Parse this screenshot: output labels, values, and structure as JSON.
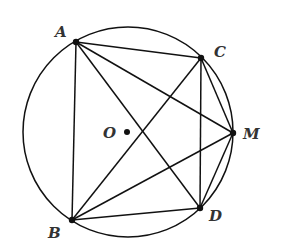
{
  "diagram": {
    "canvas": {
      "width": 283,
      "height": 252,
      "background": "#ffffff"
    },
    "stroke_color": "#111111",
    "circle": {
      "name": "circle-O",
      "cx": 128,
      "cy": 132,
      "r": 105
    },
    "center": {
      "label": "O",
      "x": 127,
      "y": 132,
      "label_x": 103,
      "label_y": 138
    },
    "points": [
      {
        "id": "A",
        "label": "A",
        "x": 76,
        "y": 42,
        "label_x": 55,
        "label_y": 37
      },
      {
        "id": "C",
        "label": "C",
        "x": 201,
        "y": 58,
        "label_x": 214,
        "label_y": 57
      },
      {
        "id": "M",
        "label": "M",
        "x": 233,
        "y": 133,
        "label_x": 243,
        "label_y": 139
      },
      {
        "id": "D",
        "label": "D",
        "x": 200,
        "y": 208,
        "label_x": 209,
        "label_y": 221
      },
      {
        "id": "B",
        "label": "B",
        "x": 72,
        "y": 220,
        "label_x": 48,
        "label_y": 238
      }
    ],
    "segments": [
      [
        "A",
        "B"
      ],
      [
        "A",
        "C"
      ],
      [
        "A",
        "D"
      ],
      [
        "A",
        "M"
      ],
      [
        "B",
        "C"
      ],
      [
        "B",
        "D"
      ],
      [
        "B",
        "M"
      ],
      [
        "C",
        "D"
      ],
      [
        "C",
        "M"
      ],
      [
        "D",
        "M"
      ]
    ]
  }
}
